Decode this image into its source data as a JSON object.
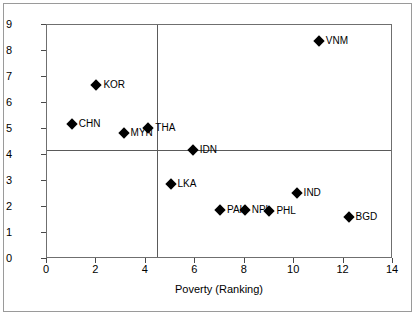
{
  "chart_data": {
    "type": "scatter",
    "title": "",
    "xlabel": "Poverty (Ranking)",
    "ylabel": "Economic Growth",
    "xlim": [
      0,
      14
    ],
    "ylim": [
      0,
      9
    ],
    "xticks": [
      0,
      2,
      4,
      6,
      8,
      10,
      12,
      14
    ],
    "yticks": [
      0,
      1,
      2,
      3,
      4,
      5,
      6,
      7,
      8,
      9
    ],
    "grid": false,
    "legend": "none",
    "marker": "diamond",
    "marker_color": "#000000",
    "reference_lines": [
      {
        "axis": "vertical",
        "value": 4.45
      },
      {
        "axis": "horizontal",
        "value": 4.18
      }
    ],
    "points": [
      {
        "label": "CHN",
        "x": 1.0,
        "y": 5.2
      },
      {
        "label": "KOR",
        "x": 2.0,
        "y": 6.7
      },
      {
        "label": "MYN",
        "x": 3.1,
        "y": 4.85
      },
      {
        "label": "THA",
        "x": 4.1,
        "y": 5.05
      },
      {
        "label": "LKA",
        "x": 5.0,
        "y": 2.9
      },
      {
        "label": "IDN",
        "x": 5.9,
        "y": 4.2
      },
      {
        "label": "PAK",
        "x": 7.0,
        "y": 1.9
      },
      {
        "label": "NPL",
        "x": 8.0,
        "y": 1.9
      },
      {
        "label": "PHL",
        "x": 9.0,
        "y": 1.85
      },
      {
        "label": "IND",
        "x": 10.1,
        "y": 2.55
      },
      {
        "label": "VNM",
        "x": 11.0,
        "y": 8.4
      },
      {
        "label": "BGD",
        "x": 12.2,
        "y": 1.6
      }
    ]
  }
}
